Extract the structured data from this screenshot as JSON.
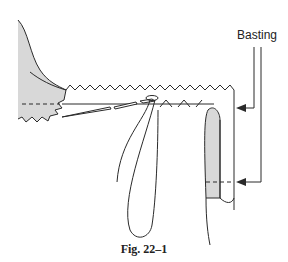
{
  "figure": {
    "caption": "Fig. 22–1",
    "labels": {
      "basting": "Basting"
    },
    "colors": {
      "line": "#2a2a2a",
      "fabric_fill": "#d8d8d8",
      "background": "#ffffff"
    },
    "parts": [
      "fabric-left-shaded",
      "zigzag-pinked-edge-top",
      "zigzag-pinked-edge-bottom",
      "basting-dashed-line",
      "needle",
      "thread-loop",
      "folded-hem-right",
      "basting-arrow-upper",
      "basting-arrow-lower"
    ]
  }
}
